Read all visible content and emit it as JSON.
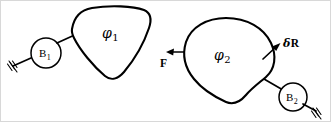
{
  "figure": {
    "kind": "mechanism-diagram",
    "width": 331,
    "height": 122,
    "background_color": "#ffffff",
    "ink_color": "#000000"
  },
  "labels": {
    "region_1": {
      "symbol": "φ",
      "subscript": "1"
    },
    "region_2": {
      "symbol": "φ",
      "subscript": "2"
    },
    "body_1": {
      "symbol": "B",
      "subscript": "1"
    },
    "body_2": {
      "symbol": "B",
      "subscript": "2"
    },
    "force_vector": "F",
    "displacement_vector": {
      "delta": "δ",
      "symbol": "R"
    }
  },
  "icons": {
    "ground_support_left": "ground-hatch-icon",
    "ground_support_right": "ground-hatch-icon",
    "force_arrow": "arrow-left-icon",
    "displacement_arrow": "arrow-up-right-icon"
  },
  "annotations": {
    "blob_1_name": "closed-region-phi-1",
    "blob_2_name": "closed-region-phi-2"
  }
}
